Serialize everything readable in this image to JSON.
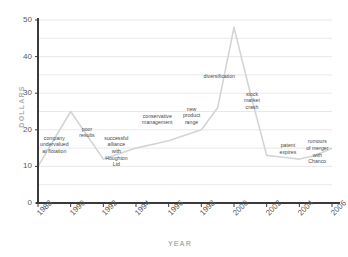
{
  "chart_data": {
    "type": "line",
    "title": "",
    "xlabel": "YEAR",
    "ylabel": "DOLLARS",
    "xlim": [
      1988,
      2006
    ],
    "ylim": [
      0,
      50
    ],
    "grid": true,
    "legend": "none",
    "x_ticks": [
      "1988",
      "1990",
      "1992",
      "1994",
      "1996",
      "1998",
      "2000",
      "2002",
      "2004",
      "2006"
    ],
    "y_ticks": [
      "0",
      "10",
      "20",
      "30",
      "40",
      "50"
    ],
    "x": [
      1988,
      1990,
      1992,
      1994,
      1996,
      1998,
      1999,
      2000,
      2001,
      2002,
      2003,
      2004,
      2005,
      2006
    ],
    "values": [
      10,
      25,
      12,
      15,
      17,
      20,
      26,
      48,
      30,
      13,
      12.5,
      12,
      13,
      15
    ],
    "series": [
      {
        "name": "share price",
        "values": [
          10,
          25,
          12,
          15,
          17,
          20,
          26,
          48,
          30,
          13,
          12.5,
          12,
          13,
          15
        ]
      }
    ],
    "line_color": "#d4d4d4",
    "grid_color": "#e2e2e2",
    "axis_color": "#3a3a3a",
    "annotations": [
      {
        "id": "company-undervalued",
        "text": "company\nundervalued\nat flotation",
        "x": 1989,
        "y": 17
      },
      {
        "id": "poor-results",
        "text": "poor\nresults",
        "x": 1991,
        "y": 19.5
      },
      {
        "id": "successful-alliance",
        "text": "successful\nalliance\nwith\nHoughton\nLtd",
        "x": 1992.8,
        "y": 17
      },
      {
        "id": "conservative-management",
        "text": "conservative\nmanagement",
        "x": 1995.3,
        "y": 23
      },
      {
        "id": "new-product-range",
        "text": "new\nproduct\nrange",
        "x": 1997.4,
        "y": 25
      },
      {
        "id": "diversification",
        "text": "diversification",
        "x": 1999.1,
        "y": 34
      },
      {
        "id": "stock-market-crash",
        "text": "stock\nmarket\ncrash",
        "x": 2001.1,
        "y": 29
      },
      {
        "id": "patent-expires",
        "text": "patent\nexpires",
        "x": 2003.3,
        "y": 15
      },
      {
        "id": "rumours-of-merger",
        "text": "rumours\nof merger\nwith\nChanco",
        "x": 2005.1,
        "y": 16
      }
    ]
  }
}
